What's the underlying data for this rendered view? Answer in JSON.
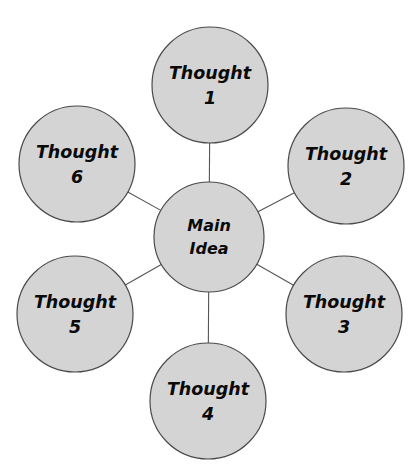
{
  "diagram": {
    "type": "mind-map",
    "background_color": "#ffffff",
    "node_fill_color": "#d4d4d4",
    "node_stroke_color": "#4a4a4a",
    "connector_color": "#555555",
    "text_color": "#0a0a0a",
    "center": {
      "id": "main-idea",
      "line1": "Main",
      "line2": "Idea",
      "cx": 209,
      "cy": 237,
      "r": 55
    },
    "nodes": [
      {
        "id": "thought-1",
        "line1": "Thought",
        "line2": "1",
        "cx": 210,
        "cy": 85,
        "r": 58,
        "position": "top"
      },
      {
        "id": "thought-2",
        "line1": "Thought",
        "line2": "2",
        "cx": 346,
        "cy": 166,
        "r": 58,
        "position": "upper-right"
      },
      {
        "id": "thought-3",
        "line1": "Thought",
        "line2": "3",
        "cx": 344,
        "cy": 314,
        "r": 58,
        "position": "lower-right"
      },
      {
        "id": "thought-4",
        "line1": "Thought",
        "line2": "4",
        "cx": 208,
        "cy": 401,
        "r": 58,
        "position": "bottom"
      },
      {
        "id": "thought-5",
        "line1": "Thought",
        "line2": "5",
        "cx": 75,
        "cy": 314,
        "r": 58,
        "position": "lower-left"
      },
      {
        "id": "thought-6",
        "line1": "Thought",
        "line2": "6",
        "cx": 77,
        "cy": 164,
        "r": 58,
        "position": "upper-left"
      }
    ],
    "connectors": [
      {
        "id": "connector-main-to-thought-1",
        "from": "main-idea",
        "to": "thought-1"
      },
      {
        "id": "connector-main-to-thought-2",
        "from": "main-idea",
        "to": "thought-2"
      },
      {
        "id": "connector-main-to-thought-3",
        "from": "main-idea",
        "to": "thought-3"
      },
      {
        "id": "connector-main-to-thought-4",
        "from": "main-idea",
        "to": "thought-4"
      },
      {
        "id": "connector-main-to-thought-5",
        "from": "main-idea",
        "to": "thought-5"
      },
      {
        "id": "connector-main-to-thought-6",
        "from": "main-idea",
        "to": "thought-6"
      }
    ]
  }
}
